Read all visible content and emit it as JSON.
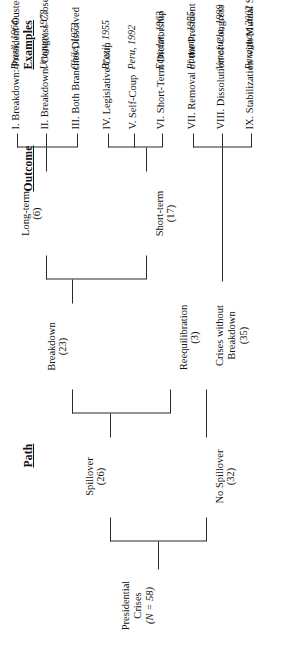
{
  "figure": {
    "orientation": "rotated-90-ccw",
    "line_color": "#2b2b2b",
    "background": "#ffffff"
  },
  "headers": {
    "path": "Path",
    "outcome": "Outcome",
    "examples": "Examples"
  },
  "root": {
    "label_line1": "Presidential",
    "label_line2": "Crises",
    "count": "(N = 58)"
  },
  "level1": [
    {
      "label": "Spillover",
      "count": "(26)"
    },
    {
      "label": "No Spillover",
      "count": "(32)"
    }
  ],
  "level2": [
    {
      "label": "Breakdown",
      "count": "(23)"
    },
    {
      "label": "Reequilibration",
      "count": "(3)"
    },
    {
      "label_line1": "Crises without",
      "label_line2": "Breakdown",
      "count": "(35)"
    }
  ],
  "level3": [
    {
      "label": "Long-term",
      "count": "(6)"
    },
    {
      "label": "Short-term",
      "count": "(17)"
    }
  ],
  "outcomes": [
    {
      "id": "I",
      "text": "I. Breakdown: President Ousted",
      "example": "Brazil, 1964"
    },
    {
      "id": "II",
      "text": "II. Breakdown: Congress Closed",
      "example": "Uruguay, 1973"
    },
    {
      "id": "III",
      "text": "III. Both Branches Dissolved",
      "example": "Chile, 1973"
    },
    {
      "id": "IV",
      "text": "IV. Legislative Coup",
      "example": "Brazil, 1955"
    },
    {
      "id": "V",
      "text": "V. Self-Coup",
      "example": "Peru, 1992"
    },
    {
      "id": "VI",
      "text": "VI. Short-Term Dictatorship",
      "example": "Ecuador, 1963"
    },
    {
      "id": "VII",
      "text": "VII. Removal of the President",
      "example": "Panama, 1955"
    },
    {
      "id": "VIII",
      "text": "VIII. Dissolution of Congress",
      "example": "Venezuela, 1999"
    },
    {
      "id": "IX",
      "text": "IX. Stabilization with Mutual Survival",
      "example": "Paraguay, 2002"
    }
  ]
}
